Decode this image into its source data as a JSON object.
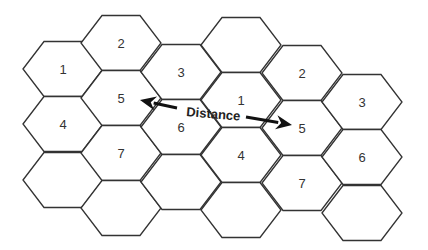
{
  "diagram": {
    "hex_geometry": {
      "half_width": 40,
      "top_half_width": 19,
      "half_height": 27.5
    },
    "colors": {
      "stroke": "#333333",
      "fill": "#ffffff",
      "text": "#333333",
      "arrow": "#111111"
    },
    "cells": [
      {
        "id": "c0r0",
        "cx": 63,
        "cy": 69,
        "label": "1"
      },
      {
        "id": "c0r1",
        "cx": 63,
        "cy": 124,
        "label": "4"
      },
      {
        "id": "c0r2",
        "cx": 63,
        "cy": 180,
        "label": ""
      },
      {
        "id": "c1r0",
        "cx": 121,
        "cy": 43,
        "label": "2"
      },
      {
        "id": "c1r1",
        "cx": 121,
        "cy": 98,
        "label": "5"
      },
      {
        "id": "c1r2",
        "cx": 121,
        "cy": 153,
        "label": "7"
      },
      {
        "id": "c1r3",
        "cx": 121,
        "cy": 208,
        "label": ""
      },
      {
        "id": "c2r0",
        "cx": 181,
        "cy": 72,
        "label": "3"
      },
      {
        "id": "c2r1",
        "cx": 181,
        "cy": 127,
        "label": "6"
      },
      {
        "id": "c2r2",
        "cx": 181,
        "cy": 182,
        "label": ""
      },
      {
        "id": "c3r0",
        "cx": 241,
        "cy": 45,
        "label": ""
      },
      {
        "id": "c3r1",
        "cx": 241,
        "cy": 100,
        "label": "1"
      },
      {
        "id": "c3r2",
        "cx": 241,
        "cy": 155,
        "label": "4"
      },
      {
        "id": "c3r3",
        "cx": 241,
        "cy": 210,
        "label": ""
      },
      {
        "id": "c4r0",
        "cx": 302,
        "cy": 73,
        "label": "2"
      },
      {
        "id": "c4r1",
        "cx": 302,
        "cy": 128,
        "label": "5"
      },
      {
        "id": "c4r2",
        "cx": 302,
        "cy": 183,
        "label": "7"
      },
      {
        "id": "c5r0",
        "cx": 362,
        "cy": 102,
        "label": "3"
      },
      {
        "id": "c5r1",
        "cx": 362,
        "cy": 157,
        "label": "6"
      },
      {
        "id": "c5r2",
        "cx": 362,
        "cy": 213,
        "label": ""
      }
    ],
    "distance_arrow": {
      "label": "Distance",
      "label_x": 186,
      "label_y": 116,
      "label_rotation": 5,
      "left_arrow": {
        "x1": 177,
        "y1": 108,
        "x2": 140,
        "y2": 100
      },
      "right_arrow": {
        "x1": 246,
        "y1": 117,
        "x2": 292,
        "y2": 125
      }
    }
  }
}
